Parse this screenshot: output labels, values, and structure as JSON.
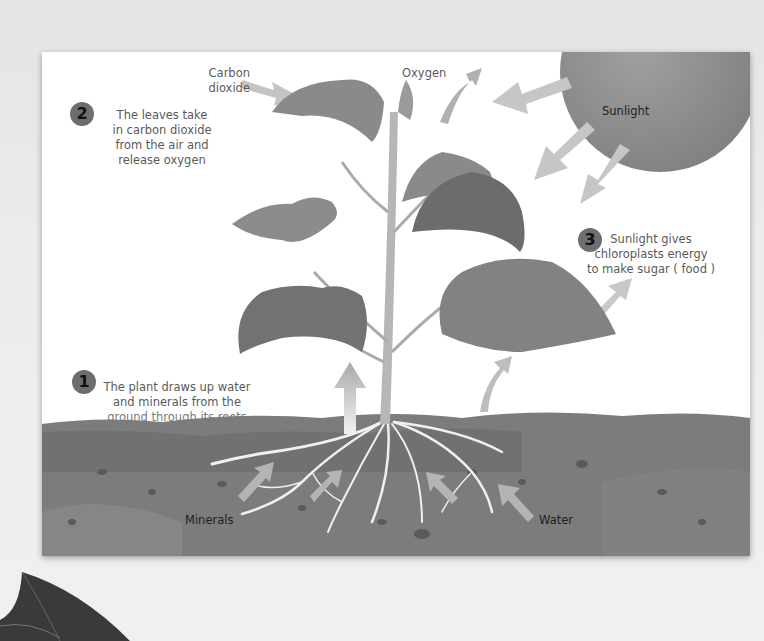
{
  "diagram": {
    "labels": {
      "carbon_dioxide": "Carbon\ndioxide",
      "carbon_line1": "Carbon",
      "carbon_line2": "dioxide",
      "oxygen": "Oxygen",
      "sunlight": "Sunlight",
      "minerals": "Minerals",
      "water": "Water"
    },
    "steps": [
      {
        "number": "1",
        "lines": [
          "The plant draws up water",
          "and minerals from the",
          "ground through its roots"
        ]
      },
      {
        "number": "2",
        "lines": [
          "The leaves take",
          "in carbon dioxide",
          "from the air and",
          "release oxygen"
        ]
      },
      {
        "number": "3",
        "lines": [
          "Sunlight gives",
          "chloroplasts energy",
          "to make sugar ( food )"
        ]
      }
    ],
    "colors": {
      "sun": "#8c8c8c",
      "soil": "#7a7a7a",
      "soil_dark": "#5f5f5f",
      "leaf": "#8a8a8a",
      "leaf_dark": "#6a6a6a",
      "arrow": "#c4c4c4",
      "stem": "#b4b4b4",
      "root": "#f2f2f2"
    }
  }
}
